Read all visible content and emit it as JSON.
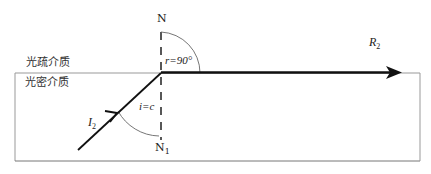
{
  "diagram": {
    "media": {
      "upper": "光疏介质",
      "lower": "光密介质"
    },
    "normal": {
      "top_label": "N",
      "bottom_label": "N",
      "bottom_label_sub": "1"
    },
    "incident_ray": {
      "label": "I",
      "label_sub": "2",
      "angle_label": "i=c"
    },
    "refracted_ray": {
      "label": "R",
      "label_sub": "2",
      "angle_label": "r=90°"
    },
    "colors": {
      "line": "#111111",
      "border": "#888888",
      "text": "#222222"
    }
  }
}
